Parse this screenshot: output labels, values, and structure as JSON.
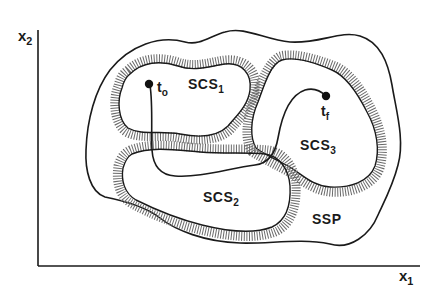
{
  "diagram": {
    "axes": {
      "x_label_main": "x",
      "x_label_sub": "1",
      "y_label_main": "x",
      "y_label_sub": "2"
    },
    "regions": {
      "outer": {
        "label": "SSP"
      },
      "scs1": {
        "main": "SCS",
        "sub": "1"
      },
      "scs2": {
        "main": "SCS",
        "sub": "2"
      },
      "scs3": {
        "main": "SCS",
        "sub": "3"
      }
    },
    "trajectory": {
      "start": {
        "main": "t",
        "sub": "o"
      },
      "end": {
        "main": "t",
        "sub": "f"
      }
    },
    "colors": {
      "line": "#1a1a1a",
      "hatch": "#555555",
      "background": "#ffffff"
    }
  }
}
